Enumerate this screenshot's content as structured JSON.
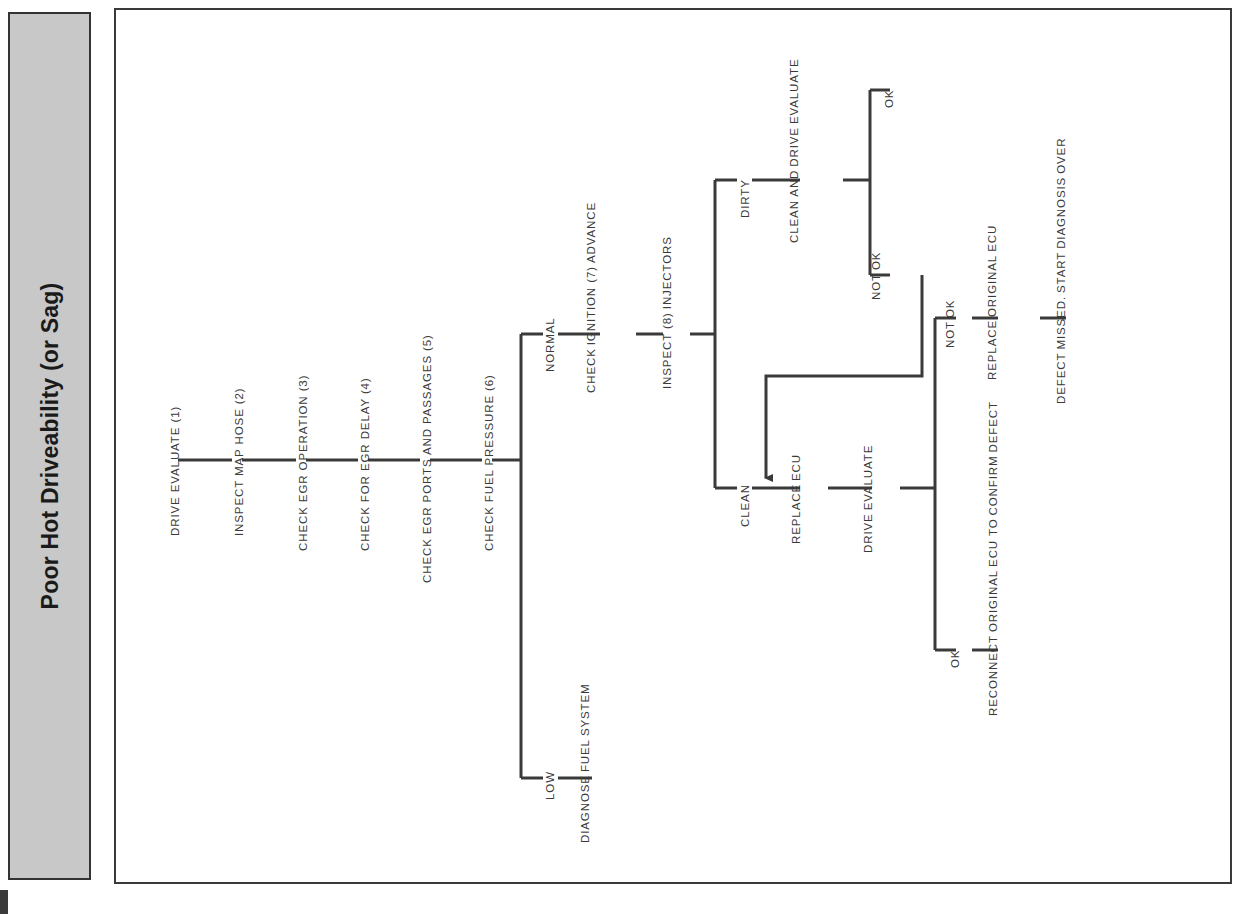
{
  "sidebar": {
    "title": "Poor Hot Driveability (or Sag)"
  },
  "diagram": {
    "type": "flowchart",
    "orientation": "rotated-90",
    "title": "Poor Hot Driveability (or Sag)",
    "nodes": [
      {
        "id": "n1",
        "label": "DRIVE EVALUATE (1)",
        "lines": [
          "DRIVE EVALUATE (1)"
        ]
      },
      {
        "id": "n2",
        "label": "INSPECT MAP HOSE (2)",
        "lines": [
          "INSPECT MAP HOSE (2)"
        ]
      },
      {
        "id": "n3",
        "label": "CHECK EGR OPERATION (3)",
        "lines": [
          "CHECK EGR OPERATION (3)"
        ]
      },
      {
        "id": "n4",
        "label": "CHECK FOR EGR DELAY (4)",
        "lines": [
          "CHECK FOR EGR DELAY (4)"
        ]
      },
      {
        "id": "n5",
        "label": "CHECK EGR PORTS AND PASSAGES (5)",
        "lines": [
          "CHECK EGR PORTS AND PASSAGES (5)"
        ]
      },
      {
        "id": "n6",
        "label": "CHECK FUEL PRESSURE (6)",
        "lines": [
          "CHECK FUEL PRESSURE (6)"
        ]
      },
      {
        "id": "n7",
        "label": "CHECK IGNITION (7) ADVANCE",
        "lines": [
          "CHECK",
          "IGNITION (7)",
          "ADVANCE"
        ]
      },
      {
        "id": "n8",
        "label": "INSPECT (8) INJECTORS",
        "lines": [
          "INSPECT (8)",
          "INJECTORS"
        ]
      },
      {
        "id": "n9",
        "label": "DIAGNOSE FUEL SYSTEM",
        "lines": [
          "DIAGNOSE",
          "FUEL",
          "SYSTEM"
        ]
      },
      {
        "id": "n10",
        "label": "CLEAN AND DRIVE EVALUATE",
        "lines": [
          "CLEAN AND",
          "DRIVE",
          "EVALUATE"
        ]
      },
      {
        "id": "n11",
        "label": "REPLACE ECU",
        "lines": [
          "REPLACE",
          "ECU"
        ]
      },
      {
        "id": "n12",
        "label": "DRIVE EVALUATE",
        "lines": [
          "DRIVE",
          "EVALUATE"
        ]
      },
      {
        "id": "n13",
        "label": "REPLACE ORIGINAL ECU",
        "lines": [
          "REPLACE",
          "ORIGINAL",
          "ECU"
        ]
      },
      {
        "id": "n14",
        "label": "DEFECT MISSED. START DIAGNOSIS OVER",
        "lines": [
          "DEFECT",
          "MISSED.",
          "START",
          "DIAGNOSIS",
          "OVER"
        ]
      },
      {
        "id": "n15",
        "label": "RECONNECT ORIGINAL ECU TO CONFIRM DEFECT",
        "lines": [
          "RECONNECT",
          "ORIGINAL",
          "ECU TO",
          "CONFIRM",
          "DEFECT"
        ]
      }
    ],
    "branch_labels": [
      {
        "id": "b1",
        "label": "NORMAL",
        "lines": [
          "NORMAL"
        ]
      },
      {
        "id": "b2",
        "label": "LOW",
        "lines": [
          "LOW"
        ]
      },
      {
        "id": "b3",
        "label": "DIRTY",
        "lines": [
          "DIRTY"
        ]
      },
      {
        "id": "b4",
        "label": "CLEAN",
        "lines": [
          "CLEAN"
        ]
      },
      {
        "id": "b5",
        "label": "OK",
        "lines": [
          "OK"
        ]
      },
      {
        "id": "b6",
        "label": "NOT OK",
        "lines": [
          "NOT",
          "OK"
        ]
      },
      {
        "id": "b7",
        "label": "NOT OK",
        "lines": [
          "NOT",
          "OK"
        ]
      },
      {
        "id": "b8",
        "label": "OK",
        "lines": [
          "OK"
        ]
      }
    ],
    "colors": {
      "line": "#3a3a3a",
      "frame": "#3a3a3a",
      "sidebar_fill": "#c8c8c8",
      "text": "#3a3a3a",
      "background": "#ffffff"
    }
  }
}
